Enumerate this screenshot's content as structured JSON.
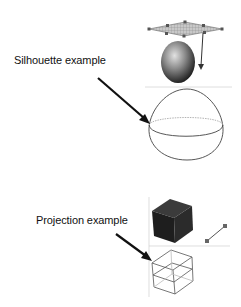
{
  "labels": {
    "silhouette": "Silhouette example",
    "projection": "Projection example"
  },
  "colors": {
    "background": "#ffffff",
    "text": "#111111",
    "arrow": "#111111",
    "wire": "#555555",
    "guide": "#cccccc",
    "cube_fill": "#2a2a2a",
    "egg_fill_light": "#d8d8d8",
    "egg_fill_dark": "#1a1a1a",
    "plane_fill": "#bdbdbd"
  },
  "panels": [
    {
      "name": "silhouette",
      "items": [
        "light-plane",
        "shaded-egg",
        "light-direction-arrow",
        "wireframe-egg-silhouette"
      ]
    },
    {
      "name": "projection",
      "items": [
        "shaded-cube",
        "light-segment",
        "wireframe-cube-projection"
      ]
    }
  ]
}
